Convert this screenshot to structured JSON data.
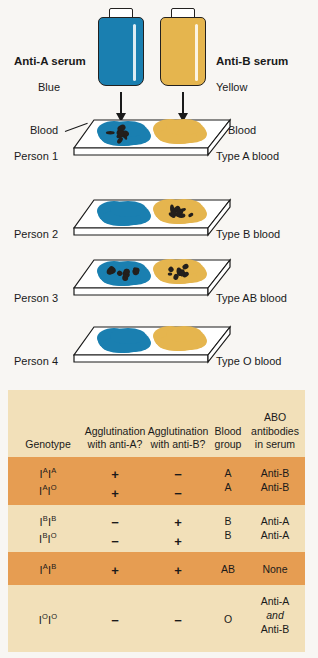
{
  "figure": {
    "background_color": "#f8f6f3",
    "serum_blue_color": "#1a7fb0",
    "serum_yellow_color": "#e5b54e"
  },
  "sera": {
    "anti_a": {
      "name_label": "Anti-A serum",
      "color_label": "Blue",
      "icon": "serum-bottle-blue"
    },
    "anti_b": {
      "name_label": "Anti-B serum",
      "color_label": "Yellow",
      "icon": "serum-bottle-yellow"
    }
  },
  "callouts": {
    "blood_left": "Blood",
    "blood_right": "Blood"
  },
  "slides": [
    {
      "person_label": "Person 1",
      "type_label": "Type A blood",
      "anti_a_drop": {
        "color": "#1a7fb0",
        "agglutinated": true
      },
      "anti_b_drop": {
        "color": "#e5b54e",
        "agglutinated": false
      }
    },
    {
      "person_label": "Person 2",
      "type_label": "Type B blood",
      "anti_a_drop": {
        "color": "#1a7fb0",
        "agglutinated": false
      },
      "anti_b_drop": {
        "color": "#e5b54e",
        "agglutinated": true
      }
    },
    {
      "person_label": "Person 3",
      "type_label": "Type AB blood",
      "anti_a_drop": {
        "color": "#1a7fb0",
        "agglutinated": true
      },
      "anti_b_drop": {
        "color": "#e5b54e",
        "agglutinated": true
      }
    },
    {
      "person_label": "Person 4",
      "type_label": "Type O blood",
      "anti_a_drop": {
        "color": "#1a7fb0",
        "agglutinated": false
      },
      "anti_b_drop": {
        "color": "#e5b54e",
        "agglutinated": false
      }
    }
  ],
  "table": {
    "row_colors": {
      "cream": "#f2e0b9",
      "orange": "#e69d52"
    },
    "headers": {
      "genotype": "Genotype",
      "agglutination_anti_a": "Agglutination with anti-A?",
      "agglutination_anti_b": "Agglutination with anti-B?",
      "blood_group": "Blood group",
      "abo_antibodies": "ABO antibodies in serum"
    },
    "header_lines": {
      "genotype": [
        "Genotype"
      ],
      "agglutination_anti_a": [
        "Agglutination",
        "with anti-A?"
      ],
      "agglutination_anti_b": [
        "Agglutination",
        "with anti-B?"
      ],
      "blood_group": [
        "Blood",
        "group"
      ],
      "abo_antibodies": [
        "ABO",
        "antibodies",
        "in serum"
      ]
    },
    "rows": [
      {
        "shade": "orange",
        "genotypes": [
          {
            "allele1": "I",
            "sup1": "A",
            "allele2": "I",
            "sup2": "A"
          },
          {
            "allele1": "I",
            "sup1": "A",
            "allele2": "I",
            "sup2": "O"
          }
        ],
        "anti_a": [
          "+",
          "+"
        ],
        "anti_b": [
          "−",
          "−"
        ],
        "blood_group": [
          "A",
          "A"
        ],
        "abo_antibodies": [
          "Anti-B",
          "Anti-B"
        ]
      },
      {
        "shade": "cream",
        "genotypes": [
          {
            "allele1": "I",
            "sup1": "B",
            "allele2": "I",
            "sup2": "B"
          },
          {
            "allele1": "I",
            "sup1": "B",
            "allele2": "I",
            "sup2": "O"
          }
        ],
        "anti_a": [
          "−",
          "−"
        ],
        "anti_b": [
          "+",
          "+"
        ],
        "blood_group": [
          "B",
          "B"
        ],
        "abo_antibodies": [
          "Anti-A",
          "Anti-A"
        ]
      },
      {
        "shade": "orange",
        "genotypes": [
          {
            "allele1": "I",
            "sup1": "A",
            "allele2": "I",
            "sup2": "B"
          }
        ],
        "anti_a": [
          "+"
        ],
        "anti_b": [
          "+"
        ],
        "blood_group": [
          "AB"
        ],
        "abo_antibodies": [
          "None"
        ]
      },
      {
        "shade": "cream",
        "genotypes": [
          {
            "allele1": "I",
            "sup1": "O",
            "allele2": "I",
            "sup2": "O"
          }
        ],
        "anti_a": [
          "−"
        ],
        "anti_b": [
          "−"
        ],
        "blood_group": [
          "O"
        ],
        "abo_antibodies_lines": [
          "Anti-A",
          "and",
          "Anti-B"
        ],
        "abo_antibodies_italic_index": 1
      }
    ]
  }
}
